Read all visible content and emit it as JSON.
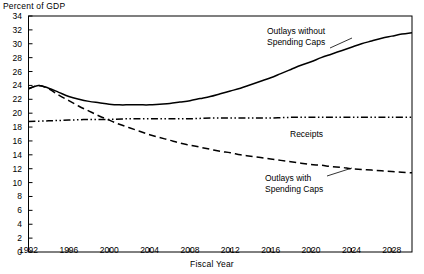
{
  "chart_data": {
    "type": "line",
    "title": "",
    "ylabel": "Percent of GDP",
    "xlabel": "Fiscal Year",
    "xlim": [
      1992,
      2030
    ],
    "ylim": [
      0,
      34
    ],
    "ytick_step": 2,
    "xtick_step": 4,
    "grid": false,
    "legend_position": "inline-annotations",
    "yticks": [
      "0",
      "2",
      "4",
      "6",
      "8",
      "10",
      "12",
      "14",
      "16",
      "18",
      "20",
      "22",
      "24",
      "26",
      "28",
      "30",
      "32",
      "34"
    ],
    "xticks": [
      "1992",
      "1996",
      "2000",
      "2004",
      "2008",
      "2012",
      "2016",
      "2020",
      "2024",
      "2028"
    ],
    "annotations": [
      {
        "id": "outlays-without",
        "text_line1": "Outlays without",
        "text_line2": "Spending Caps"
      },
      {
        "id": "receipts",
        "text_line1": "Receipts",
        "text_line2": ""
      },
      {
        "id": "outlays-with",
        "text_line1": "Outlays with",
        "text_line2": "Spending Caps"
      }
    ],
    "series": [
      {
        "name": "Outlays without Spending Caps",
        "style": "solid",
        "color": "#000000",
        "x": [
          1992,
          1993,
          1994,
          1995,
          1996,
          1997,
          1998,
          1999,
          2000,
          2001,
          2002,
          2003,
          2004,
          2005,
          2006,
          2007,
          2008,
          2009,
          2010,
          2011,
          2012,
          2013,
          2014,
          2015,
          2016,
          2017,
          2018,
          2019,
          2020,
          2021,
          2022,
          2023,
          2024,
          2025,
          2026,
          2027,
          2028,
          2029,
          2030
        ],
        "values": [
          23.5,
          24.0,
          23.6,
          23.0,
          22.4,
          22.0,
          21.7,
          21.5,
          21.3,
          21.2,
          21.2,
          21.2,
          21.2,
          21.3,
          21.4,
          21.6,
          21.8,
          22.1,
          22.4,
          22.8,
          23.2,
          23.6,
          24.1,
          24.6,
          25.1,
          25.7,
          26.3,
          26.9,
          27.4,
          28.0,
          28.5,
          29.0,
          29.5,
          30.0,
          30.4,
          30.8,
          31.1,
          31.4,
          31.6
        ]
      },
      {
        "name": "Receipts",
        "style": "dash-dot-dot",
        "color": "#000000",
        "x": [
          1992,
          1994,
          1996,
          1998,
          2000,
          2002,
          2004,
          2006,
          2008,
          2010,
          2012,
          2014,
          2016,
          2018,
          2020,
          2022,
          2024,
          2026,
          2028,
          2030
        ],
        "values": [
          18.8,
          18.9,
          19.0,
          19.1,
          19.1,
          19.2,
          19.2,
          19.2,
          19.2,
          19.3,
          19.3,
          19.3,
          19.3,
          19.4,
          19.4,
          19.4,
          19.4,
          19.4,
          19.4,
          19.4
        ]
      },
      {
        "name": "Outlays with Spending Caps",
        "style": "dashed",
        "color": "#000000",
        "x": [
          1992,
          1993,
          1994,
          1995,
          1996,
          1997,
          1998,
          1999,
          2000,
          2001,
          2002,
          2003,
          2004,
          2005,
          2006,
          2007,
          2008,
          2009,
          2010,
          2011,
          2012,
          2013,
          2014,
          2015,
          2016,
          2017,
          2018,
          2019,
          2020,
          2021,
          2022,
          2023,
          2024,
          2025,
          2026,
          2027,
          2028,
          2029,
          2030
        ],
        "values": [
          23.5,
          24.0,
          23.5,
          22.6,
          21.8,
          21.0,
          20.3,
          19.6,
          19.0,
          18.4,
          17.9,
          17.4,
          16.9,
          16.5,
          16.1,
          15.7,
          15.4,
          15.1,
          14.8,
          14.5,
          14.3,
          14.0,
          13.8,
          13.6,
          13.4,
          13.2,
          13.0,
          12.8,
          12.6,
          12.5,
          12.3,
          12.2,
          12.0,
          11.9,
          11.8,
          11.7,
          11.6,
          11.5,
          11.4
        ]
      }
    ]
  }
}
